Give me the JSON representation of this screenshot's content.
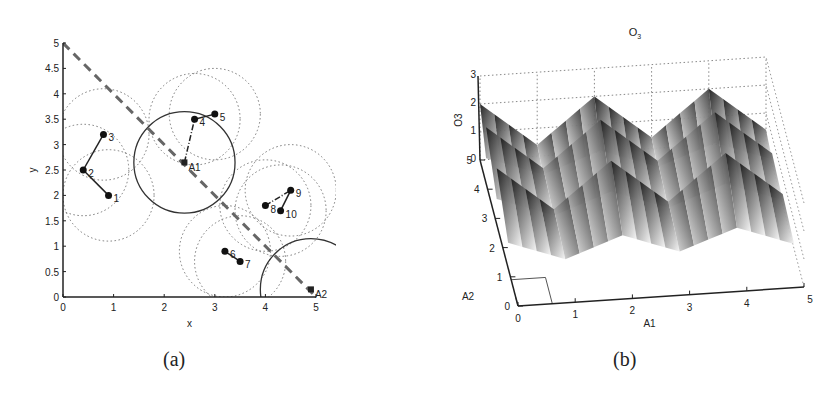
{
  "chart_data": [
    {
      "type": "scatter",
      "panel": "(a)",
      "xlabel": "x",
      "ylabel": "y",
      "xlim": [
        0,
        5
      ],
      "ylim": [
        0,
        5
      ],
      "xticks": [
        "0",
        "1",
        "2",
        "3",
        "4",
        "5"
      ],
      "yticks": [
        "0",
        "0.5",
        "1",
        "1.5",
        "2",
        "2.5",
        "3",
        "3.5",
        "4",
        "4.5",
        "5"
      ],
      "points": [
        {
          "label": "1",
          "x": 0.9,
          "y": 2.0
        },
        {
          "label": "2",
          "x": 0.4,
          "y": 2.5
        },
        {
          "label": "3",
          "x": 0.8,
          "y": 3.2
        },
        {
          "label": "4",
          "x": 2.6,
          "y": 3.5
        },
        {
          "label": "5",
          "x": 3.0,
          "y": 3.6
        },
        {
          "label": "6",
          "x": 3.2,
          "y": 0.9
        },
        {
          "label": "7",
          "x": 3.5,
          "y": 0.7
        },
        {
          "label": "8",
          "x": 4.0,
          "y": 1.8
        },
        {
          "label": "9",
          "x": 4.5,
          "y": 2.1
        },
        {
          "label": "10",
          "x": 4.3,
          "y": 1.7
        }
      ],
      "anchors": [
        {
          "label": "A1",
          "x": 2.4,
          "y": 2.65
        },
        {
          "label": "A2",
          "x": 4.9,
          "y": 0.15
        }
      ],
      "dashed_line": {
        "from": [
          0,
          5
        ],
        "to": [
          5,
          0
        ]
      },
      "solid_circles": [
        {
          "cx": 2.4,
          "cy": 2.65,
          "r": 1.0
        },
        {
          "cx": 4.9,
          "cy": 0.15,
          "r": 1.0
        }
      ]
    },
    {
      "type": "surface",
      "panel": "(b)",
      "title": "O3",
      "xlabel": "A1",
      "ylabel": "A2",
      "zlabel": "O3",
      "xticks": [
        "0",
        "1",
        "2",
        "3",
        "4",
        "5"
      ],
      "yticks": [
        "0",
        "1",
        "2",
        "3",
        "4",
        "5"
      ],
      "zticks": [
        "0",
        "1",
        "2",
        "3"
      ],
      "xlim": [
        0,
        5
      ],
      "ylim": [
        0,
        5
      ],
      "zlim": [
        0,
        3
      ]
    }
  ],
  "captions": {
    "a": "(a)",
    "b": "(b)"
  },
  "labels": {
    "a_x": "x",
    "a_y": "y",
    "b_title_main": "O",
    "b_title_sub": "3",
    "b_x": "A1",
    "b_y": "A2",
    "b_z": "O3"
  }
}
